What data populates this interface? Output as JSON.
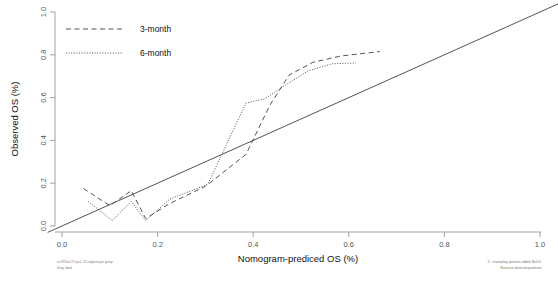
{
  "chart_data": {
    "type": "line",
    "title": "",
    "xlabel": "Nomogram-prediced OS (%)",
    "ylabel": "Observed OS (%)",
    "xlim": [
      -0.04,
      1.04
    ],
    "ylim": [
      -0.04,
      1.04
    ],
    "xticks": [
      0.0,
      0.2,
      0.4,
      0.6,
      0.8,
      1.0
    ],
    "yticks": [
      0.0,
      0.2,
      0.4,
      0.6,
      0.8,
      1.0
    ],
    "xtick_labels": [
      "0.0",
      "0.2",
      "0.4",
      "0.6",
      "0.8",
      "1.0"
    ],
    "ytick_labels": [
      "0.0",
      "0.2",
      "0.4",
      "0.6",
      "0.8",
      "1.0"
    ],
    "grid": false,
    "legend_position": "top-left",
    "series": [
      {
        "name": "ideal",
        "style": "solid",
        "color": "#404040",
        "points": [
          [
            -0.03,
            -0.03
          ],
          [
            1.04,
            1.04
          ]
        ]
      },
      {
        "name": "3-month",
        "style": "dashed",
        "color": "#404040",
        "points": [
          [
            0.045,
            0.175
          ],
          [
            0.1,
            0.095
          ],
          [
            0.145,
            0.165
          ],
          [
            0.175,
            0.035
          ],
          [
            0.225,
            0.105
          ],
          [
            0.3,
            0.185
          ],
          [
            0.385,
            0.335
          ],
          [
            0.435,
            0.565
          ],
          [
            0.475,
            0.705
          ],
          [
            0.525,
            0.765
          ],
          [
            0.585,
            0.795
          ],
          [
            0.665,
            0.815
          ]
        ]
      },
      {
        "name": "6-month",
        "style": "dotted",
        "color": "#404040",
        "points": [
          [
            0.055,
            0.115
          ],
          [
            0.105,
            0.025
          ],
          [
            0.145,
            0.115
          ],
          [
            0.175,
            0.025
          ],
          [
            0.225,
            0.125
          ],
          [
            0.305,
            0.195
          ],
          [
            0.385,
            0.575
          ],
          [
            0.425,
            0.595
          ],
          [
            0.465,
            0.655
          ],
          [
            0.515,
            0.725
          ],
          [
            0.565,
            0.758
          ],
          [
            0.615,
            0.762
          ]
        ]
      }
    ]
  },
  "legend": {
    "entries": [
      {
        "label": "3-month",
        "style": "dashed"
      },
      {
        "label": "6-month",
        "style": "dotted"
      }
    ]
  },
  "footnotes": {
    "bottom_left_line1": "n=193 d=172 p=1, 25 subjects per group",
    "bottom_left_line2": "Gray: ideal",
    "bottom_right_line1": "X - resampling optimism added, B=500",
    "bottom_right_line2": "Based on observed-predicted"
  },
  "colors": {
    "axis": "#808080",
    "line": "#404040",
    "text": "#111111",
    "muted": "#777777"
  }
}
